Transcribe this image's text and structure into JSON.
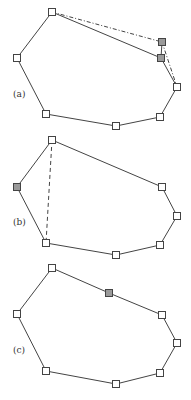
{
  "figure": {
    "panels": [
      {
        "label": "(a)",
        "label_pos": [
          13,
          97
        ],
        "polygon": [
          [
            52,
            12
          ],
          [
            161,
            58
          ],
          [
            177,
            87
          ],
          [
            160,
            117
          ],
          [
            116,
            126
          ],
          [
            46,
            114
          ],
          [
            17,
            58
          ]
        ],
        "extra_solid_edges": [
          [
            [
              162,
              42
            ],
            [
              161,
              58
            ]
          ]
        ],
        "dashed_edges": [
          [
            [
              52,
              12
            ],
            [
              162,
              42
            ]
          ],
          [
            [
              162,
              42
            ],
            [
              177,
              87
            ]
          ]
        ],
        "nodes": [
          {
            "x": 52,
            "y": 12,
            "shaded": false
          },
          {
            "x": 162,
            "y": 42,
            "shaded": true
          },
          {
            "x": 161,
            "y": 58,
            "shaded": true
          },
          {
            "x": 177,
            "y": 87,
            "shaded": false
          },
          {
            "x": 160,
            "y": 117,
            "shaded": false
          },
          {
            "x": 116,
            "y": 126,
            "shaded": false
          },
          {
            "x": 46,
            "y": 114,
            "shaded": false
          },
          {
            "x": 17,
            "y": 58,
            "shaded": false
          }
        ]
      },
      {
        "label": "(b)",
        "label_pos": [
          13,
          225
        ],
        "polygon": [
          [
            52,
            140
          ],
          [
            162,
            187
          ],
          [
            177,
            216
          ],
          [
            160,
            245
          ],
          [
            116,
            255
          ],
          [
            46,
            243
          ],
          [
            17,
            187
          ]
        ],
        "extra_solid_edges": [],
        "dashed_edges": [
          [
            [
              52,
              140
            ],
            [
              46,
              243
            ]
          ]
        ],
        "nodes": [
          {
            "x": 52,
            "y": 140,
            "shaded": false
          },
          {
            "x": 162,
            "y": 187,
            "shaded": false
          },
          {
            "x": 177,
            "y": 216,
            "shaded": false
          },
          {
            "x": 160,
            "y": 245,
            "shaded": false
          },
          {
            "x": 116,
            "y": 255,
            "shaded": false
          },
          {
            "x": 46,
            "y": 243,
            "shaded": false
          },
          {
            "x": 17,
            "y": 187,
            "shaded": true
          }
        ]
      },
      {
        "label": "(c)",
        "label_pos": [
          13,
          353
        ],
        "polygon": [
          [
            52,
            268
          ],
          [
            109,
            293
          ],
          [
            162,
            315
          ],
          [
            177,
            343
          ],
          [
            160,
            373
          ],
          [
            116,
            384
          ],
          [
            46,
            371
          ],
          [
            17,
            314
          ]
        ],
        "extra_solid_edges": [],
        "dashed_edges": [],
        "nodes": [
          {
            "x": 52,
            "y": 268,
            "shaded": false
          },
          {
            "x": 109,
            "y": 293,
            "shaded": true
          },
          {
            "x": 162,
            "y": 315,
            "shaded": false
          },
          {
            "x": 177,
            "y": 343,
            "shaded": false
          },
          {
            "x": 160,
            "y": 373,
            "shaded": false
          },
          {
            "x": 116,
            "y": 384,
            "shaded": false
          },
          {
            "x": 46,
            "y": 371,
            "shaded": false
          },
          {
            "x": 17,
            "y": 314,
            "shaded": false
          }
        ]
      }
    ],
    "colors": {
      "line": "#444444",
      "node_fill": "#ffffff",
      "node_shaded": "#9a9a9a"
    }
  }
}
